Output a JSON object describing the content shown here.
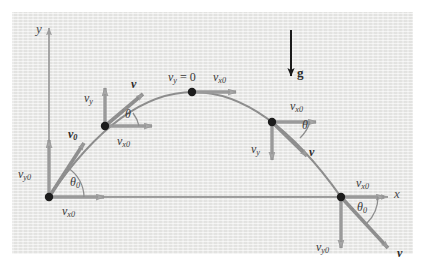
{
  "figure": {
    "background_color": "#e8e8e6",
    "page_color": "#ffffff",
    "curve_color": "#8a8a8a",
    "vector_color": "#9a9a9a",
    "gravity_color": "#1a1a1a",
    "label_color": "#3a3a3a"
  },
  "axes": {
    "y_label": "y",
    "x_label": "x",
    "origin_x": 49,
    "origin_y": 197
  },
  "gravity": {
    "label": "g",
    "direction": "down"
  },
  "points": [
    {
      "id": "launch",
      "name": "launch-point",
      "x": 49,
      "y": 197,
      "labels": [
        {
          "name": "v0-vector-label",
          "base": "v",
          "sub": "0",
          "bold": true,
          "x": 68,
          "y": 128
        },
        {
          "name": "vy0-label",
          "base": "v",
          "sub": "y0",
          "bold": false,
          "x": 18,
          "y": 168
        },
        {
          "name": "vx0-label",
          "base": "v",
          "sub": "x0",
          "bold": false,
          "x": 62,
          "y": 210
        },
        {
          "name": "theta0-label",
          "base": "θ",
          "sub": "0",
          "bold": false,
          "x": 71,
          "y": 180
        }
      ]
    },
    {
      "id": "ascending",
      "name": "ascending-point",
      "x": 105,
      "y": 126,
      "labels": [
        {
          "name": "v-vector-label",
          "base": "v",
          "sub": "",
          "bold": true,
          "x": 131,
          "y": 81
        },
        {
          "name": "vy-label",
          "base": "v",
          "sub": "y",
          "bold": false,
          "x": 84,
          "y": 95
        },
        {
          "name": "vx0-label",
          "base": "v",
          "sub": "x0",
          "bold": false,
          "x": 118,
          "y": 139
        },
        {
          "name": "theta-label",
          "base": "θ",
          "sub": "",
          "bold": false,
          "x": 126,
          "y": 113
        }
      ]
    },
    {
      "id": "apex",
      "name": "apex-point",
      "x": 192,
      "y": 92,
      "labels": [
        {
          "name": "vy-zero-label",
          "base": "v",
          "sub": "y",
          "suffix": " = 0",
          "bold": false,
          "x": 172,
          "y": 76
        },
        {
          "name": "vx0-label",
          "base": "v",
          "sub": "x0",
          "bold": false,
          "x": 213,
          "y": 76
        }
      ]
    },
    {
      "id": "descending",
      "name": "descending-point",
      "x": 272,
      "y": 122,
      "labels": [
        {
          "name": "vx0-label",
          "base": "v",
          "sub": "x0",
          "bold": false,
          "x": 291,
          "y": 105
        },
        {
          "name": "theta-label",
          "base": "θ",
          "sub": "",
          "bold": false,
          "x": 303,
          "y": 124
        },
        {
          "name": "vy-label",
          "base": "v",
          "sub": "y",
          "bold": false,
          "x": 252,
          "y": 147
        },
        {
          "name": "v-vector-label",
          "base": "v",
          "sub": "",
          "bold": true,
          "x": 309,
          "y": 149
        }
      ]
    },
    {
      "id": "landing",
      "name": "landing-point",
      "x": 341,
      "y": 197,
      "labels": [
        {
          "name": "vx0-label",
          "base": "v",
          "sub": "x0",
          "bold": false,
          "x": 357,
          "y": 182
        },
        {
          "name": "theta0-label",
          "base": "θ",
          "sub": "0",
          "bold": false,
          "x": 358,
          "y": 205
        },
        {
          "name": "vy0-label",
          "base": "v",
          "sub": "y0",
          "bold": false,
          "x": 317,
          "y": 246
        },
        {
          "name": "v-vector-label",
          "base": "v",
          "sub": "",
          "bold": true,
          "x": 398,
          "y": 251
        }
      ]
    }
  ],
  "trajectory": {
    "description": "parabolic projectile path from launch to landing",
    "start": [
      49,
      197
    ],
    "apex": [
      192,
      92
    ],
    "end": [
      341,
      197
    ]
  }
}
